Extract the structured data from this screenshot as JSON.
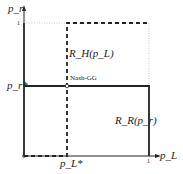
{
  "diagram": {
    "y_axis_label": "p_r",
    "x_axis_label": "p_L",
    "y_tick_one": "1",
    "x_tick_one": "1",
    "y_tick_star": "p_r*",
    "x_tick_star": "p_L*",
    "point_label": "Nash-GG",
    "curve_h_label": "R_H(p_L)",
    "curve_r_label": "R_R(p_r)",
    "colors": {
      "line": "#222222",
      "dotted": "#aaaaaa"
    }
  }
}
